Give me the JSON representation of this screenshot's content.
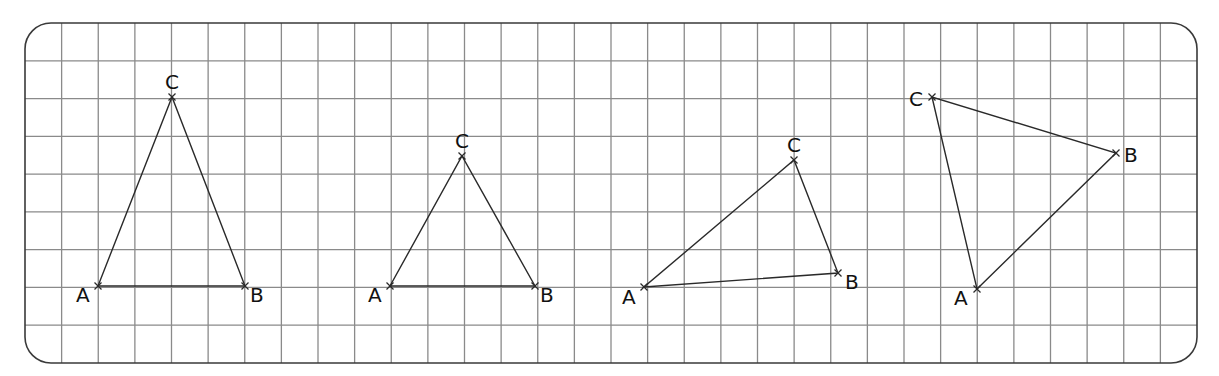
{
  "figure": {
    "grid": {
      "frame": {
        "x": 25,
        "y": 23,
        "width": 1172,
        "height": 340,
        "corner_radius": 26
      },
      "columns": 32,
      "rows": 9,
      "line_color": "#8a8a8a",
      "frame_color": "#3a3a3a"
    },
    "stroke_color": "#2a2a2a",
    "triangles": [
      {
        "name": "triangle-1",
        "vertices": {
          "A": {
            "x": 98,
            "y": 286,
            "label": "A",
            "lx": 76,
            "ly": 302
          },
          "B": {
            "x": 245,
            "y": 286,
            "label": "B",
            "lx": 250,
            "ly": 302
          },
          "C": {
            "x": 172,
            "y": 97,
            "label": "C",
            "lx": 165,
            "ly": 89
          }
        }
      },
      {
        "name": "triangle-2",
        "vertices": {
          "A": {
            "x": 390,
            "y": 286,
            "label": "A",
            "lx": 368,
            "ly": 302
          },
          "B": {
            "x": 535,
            "y": 286,
            "label": "B",
            "lx": 540,
            "ly": 302
          },
          "C": {
            "x": 462,
            "y": 156,
            "label": "C",
            "lx": 455,
            "ly": 148
          }
        }
      },
      {
        "name": "triangle-3",
        "vertices": {
          "A": {
            "x": 644,
            "y": 287,
            "label": "A",
            "lx": 622,
            "ly": 304
          },
          "B": {
            "x": 838,
            "y": 273,
            "label": "B",
            "lx": 845,
            "ly": 289
          },
          "C": {
            "x": 794,
            "y": 160,
            "label": "C",
            "lx": 787,
            "ly": 152
          }
        }
      },
      {
        "name": "triangle-4",
        "vertices": {
          "A": {
            "x": 977,
            "y": 289,
            "label": "A",
            "lx": 954,
            "ly": 305
          },
          "B": {
            "x": 1116,
            "y": 153,
            "label": "B",
            "lx": 1124,
            "ly": 162
          },
          "C": {
            "x": 932,
            "y": 97,
            "label": "C",
            "lx": 909,
            "ly": 106
          }
        }
      }
    ]
  }
}
